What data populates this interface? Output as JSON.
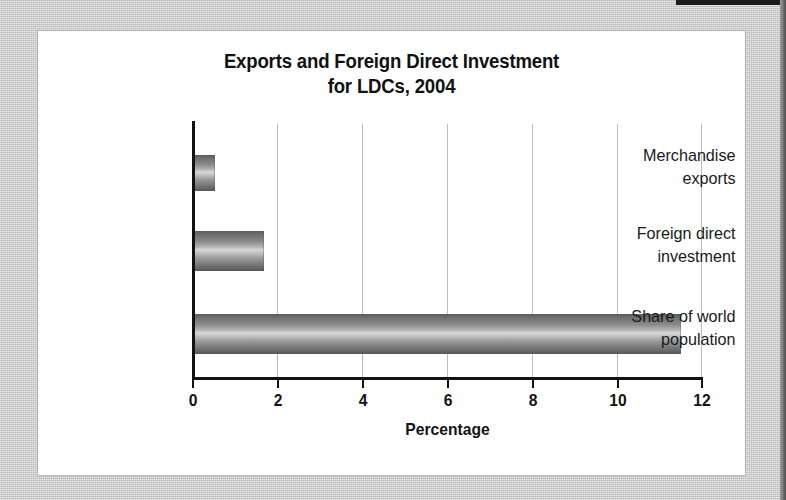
{
  "card": {
    "background_color": "#ffffff",
    "page_background_color": "#c9c9c9"
  },
  "chart_data": {
    "type": "bar",
    "orientation": "horizontal",
    "title": "Exports and Foreign Direct Investment for LDCs, 2004",
    "title_lines": [
      "Exports and Foreign Direct Investment",
      "for LDCs, 2004"
    ],
    "categories": [
      "Merchandise exports",
      "Foreign direct investment",
      "Share of world population"
    ],
    "category_lines": [
      [
        "Merchandise",
        "exports"
      ],
      [
        "Foreign direct",
        "investment"
      ],
      [
        "Share of world",
        "population"
      ]
    ],
    "values": [
      0.55,
      1.7,
      11.5
    ],
    "xlabel": "Percentage",
    "ylabel": "",
    "xlim": [
      0,
      12
    ],
    "xticks": [
      0,
      2,
      4,
      6,
      8,
      10,
      12
    ],
    "xtick_labels": [
      "0",
      "2",
      "4",
      "6",
      "8",
      "10",
      "12"
    ],
    "grid": "vertical",
    "gridline_color": "#bcbcbc",
    "axis_color": "#121212",
    "bar_fill": "gradient-gray",
    "bar_color_dark": "#565656",
    "bar_color_light": "#d8d8d8",
    "legend": null,
    "units": "percent"
  }
}
